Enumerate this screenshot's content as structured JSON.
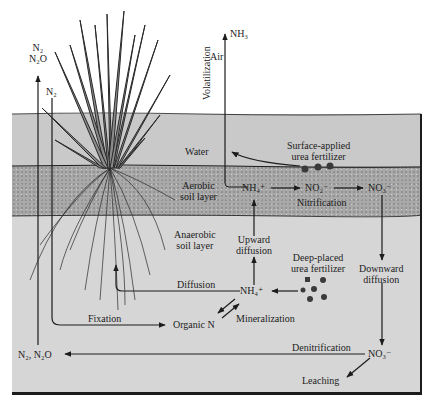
{
  "zones": {
    "air": "Air",
    "water": "Water",
    "aerobic": [
      "Aerobic",
      "soil layer"
    ],
    "anaerobic": [
      "Anaerobic",
      "soil layer"
    ]
  },
  "species": {
    "nh3": "NH₃",
    "n2_n2o_top": [
      "N₂",
      "N₂O"
    ],
    "n2_top": "N₂",
    "nh4_aerobic": "NH₄⁺",
    "no2_aerobic": "NO₂⁻",
    "no3_aerobic": "NO₃⁻",
    "nh4_anaerobic": "NH₄⁺",
    "organic_n": "Organic N",
    "no3_anaerobic": "NO₃⁻",
    "n2_n2o_bottom": "N₂, N₂O"
  },
  "processes": {
    "volatilization": "Volatilization",
    "nitrification": "Nitrification",
    "upward_diffusion": [
      "Upward",
      "diffusion"
    ],
    "downward_diffusion": [
      "Downward",
      "diffusion"
    ],
    "diffusion": "Diffusion",
    "fixation": "Fixation",
    "mineralization": "Mineralization",
    "denitrification": "Denitrification",
    "leaching": "Leaching"
  },
  "fertilizers": {
    "surface": [
      "Surface-applied",
      "urea fertilizer"
    ],
    "deep": [
      "Deep-placed",
      "urea fertilizer"
    ]
  },
  "colors": {
    "air": "#ffffff",
    "water": "#c9c9c9",
    "aerobic_soil": "#a9a9a9",
    "anaerobic_soil": "#d6d6d6",
    "ink": "#1c1c1c"
  }
}
